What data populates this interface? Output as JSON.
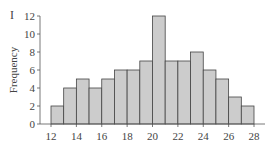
{
  "panel": {
    "label": "I"
  },
  "chart_data": {
    "type": "bar",
    "title": "",
    "xlabel": "",
    "ylabel": "Frequency",
    "bins": [
      [
        12,
        13
      ],
      [
        13,
        14
      ],
      [
        14,
        15
      ],
      [
        15,
        16
      ],
      [
        16,
        17
      ],
      [
        17,
        18
      ],
      [
        18,
        19
      ],
      [
        19,
        20
      ],
      [
        20,
        21
      ],
      [
        21,
        22
      ],
      [
        22,
        23
      ],
      [
        23,
        24
      ],
      [
        24,
        25
      ],
      [
        25,
        26
      ],
      [
        26,
        27
      ],
      [
        27,
        28
      ]
    ],
    "categories": [
      "12-13",
      "13-14",
      "14-15",
      "15-16",
      "16-17",
      "17-18",
      "18-19",
      "19-20",
      "20-21",
      "21-22",
      "22-23",
      "23-24",
      "24-25",
      "25-26",
      "26-27",
      "27-28"
    ],
    "values": [
      2,
      4,
      5,
      4,
      5,
      6,
      6,
      7,
      12,
      7,
      7,
      8,
      6,
      5,
      3,
      2
    ],
    "xlim": [
      12,
      28
    ],
    "ylim": [
      0,
      12
    ],
    "xticks": [
      12,
      14,
      16,
      18,
      20,
      22,
      24,
      26,
      28
    ],
    "yticks": [
      0,
      2,
      4,
      6,
      8,
      10,
      12
    ],
    "grid": false,
    "bar_color": "#cccccc",
    "edge_color": "#444444"
  }
}
